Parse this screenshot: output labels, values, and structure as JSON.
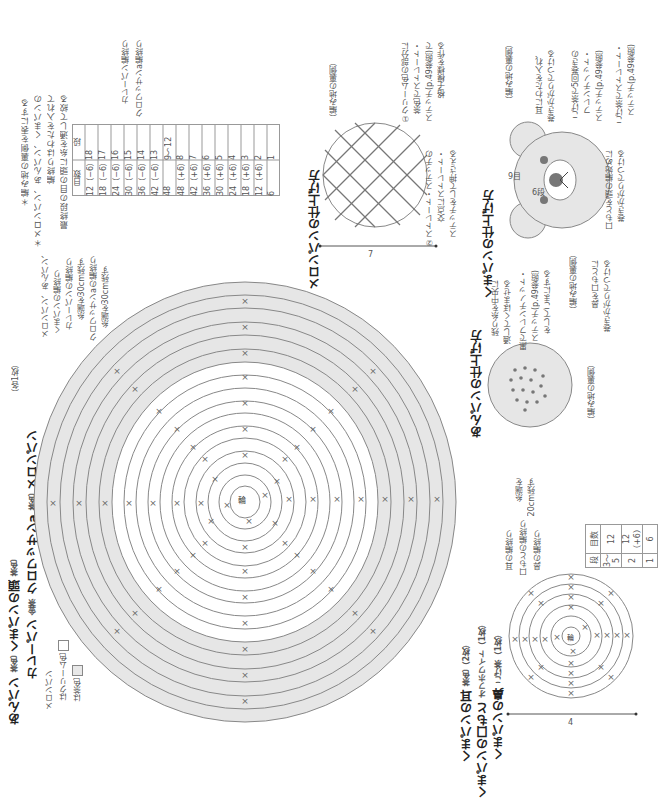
{
  "page": {
    "orientation": "rotated-90-ccw",
    "notes": [
      "＊編み地の裏側を表にする",
      "＊メロンパン、あんパン、くまパンの",
      "　編終りはわたを入れて",
      "　最終段の目の頭に糸を通して絞る"
    ],
    "main_table": {
      "headers": [
        "段",
        "目数"
      ],
      "rows": [
        [
          "18",
          "12（−6）"
        ],
        [
          "17",
          "18（−6）"
        ],
        [
          "16",
          "24（−6）"
        ],
        [
          "15",
          "30（−6）"
        ],
        [
          "14",
          "36（−6）"
        ],
        [
          "13",
          "42（−6）"
        ],
        [
          "9〜12",
          "48"
        ],
        [
          "8",
          "48（+6）"
        ],
        [
          "7",
          "42（+6）"
        ],
        [
          "6",
          "36（+6）"
        ],
        [
          "5",
          "30（+6）"
        ],
        [
          "4",
          "24（+6）"
        ],
        [
          "3",
          "18（+6）"
        ],
        [
          "2",
          "12（+6）"
        ],
        [
          "1",
          "6"
        ]
      ],
      "side_labels": [
        "カレーパン編終り",
        "クロワッサンa編終り"
      ]
    },
    "titles": {
      "line1": [
        {
          "name": "あんパン",
          "color": "茶色"
        },
        {
          "name": "くまパンの頭",
          "color": "茶色"
        }
      ],
      "line2": [
        {
          "name": "カレーパン",
          "color": "金茶"
        },
        {
          "name": "クロワッサンa",
          "color": "茶色"
        },
        {
          "name": "メロンパン",
          "color": ""
        }
      ],
      "count": "（各1枚）"
    },
    "legend": {
      "heading": "メロンパン",
      "items": [
        {
          "label": "はクリーム色",
          "swatch": "#ffffff"
        },
        {
          "label": "は茶色",
          "swatch": "#e8e8e8"
        }
      ]
    },
    "big_chart_labels": [
      "メロンパン、あんパン、",
      "くまパンの編終り",
      "カレーパンの編終り",
      "糸端を30cm残す",
      "クロワッサンaの編終り",
      "糸端を30cm残す"
    ],
    "big_chart": {
      "center_label": "輪",
      "rounds": 18,
      "shaded_rounds_from": 13
    },
    "melon": {
      "title": "メロンパンの仕上げ方",
      "labels": [
        "（編み地の裏側）",
        "①クリーム色の部分に",
        "茶色でストレート・",
        "ステッチ(p.49参照)で",
        "格子模様を作る",
        "②ストレート・ステッチの",
        "交点にストレート・",
        "ステッチをして押さえる"
      ],
      "measure": "7"
    },
    "kuma": {
      "title": "くまパンの仕上げ方",
      "labels": [
        "（編み地の裏側）",
        "耳にわたを入れ、",
        "巻きかがりでつける",
        "こげ茶で5回巻きの",
        "フレンチノット・",
        "ステッチ(p.49参照)",
        "こげ茶でストレート・",
        "ステッチ(p.49参照)",
        "口もとを頭の編始めに",
        "巻きかがりでつける",
        "（編み地の裏側）",
        "鼻を口もとに",
        "巻きかがりでつける"
      ],
      "rows_label_9": "9目",
      "rows_label_6": "6段"
    },
    "anpan": {
      "title": "あんパンの仕上げ方",
      "labels": [
        "残り糸を中央に",
        "通してくぼませる",
        "黒でフレンチノット・",
        "ステッチ(p.49参照)",
        "をしてごまにする",
        "（編み地の裏側）"
      ]
    },
    "small_parts": {
      "titles": [
        {
          "name": "くまパンの耳",
          "info": "茶色（2枚）"
        },
        {
          "name": "くまパンの口もと",
          "info": "オフホワイト（1枚）"
        },
        {
          "name": "くまパンの鼻",
          "info": "こげ茶（1枚）"
        }
      ],
      "labels": [
        "耳の編終り",
        "口もとの編終り",
        "鼻の編終り",
        "糸端を",
        "20cm残す"
      ],
      "table": {
        "headers": [
          "段",
          "目数"
        ],
        "rows": [
          [
            "3〜5",
            "12"
          ],
          [
            "2",
            "12（+6）"
          ],
          [
            "1",
            "6"
          ]
        ]
      },
      "center_label": "輪",
      "measure": "4"
    }
  }
}
